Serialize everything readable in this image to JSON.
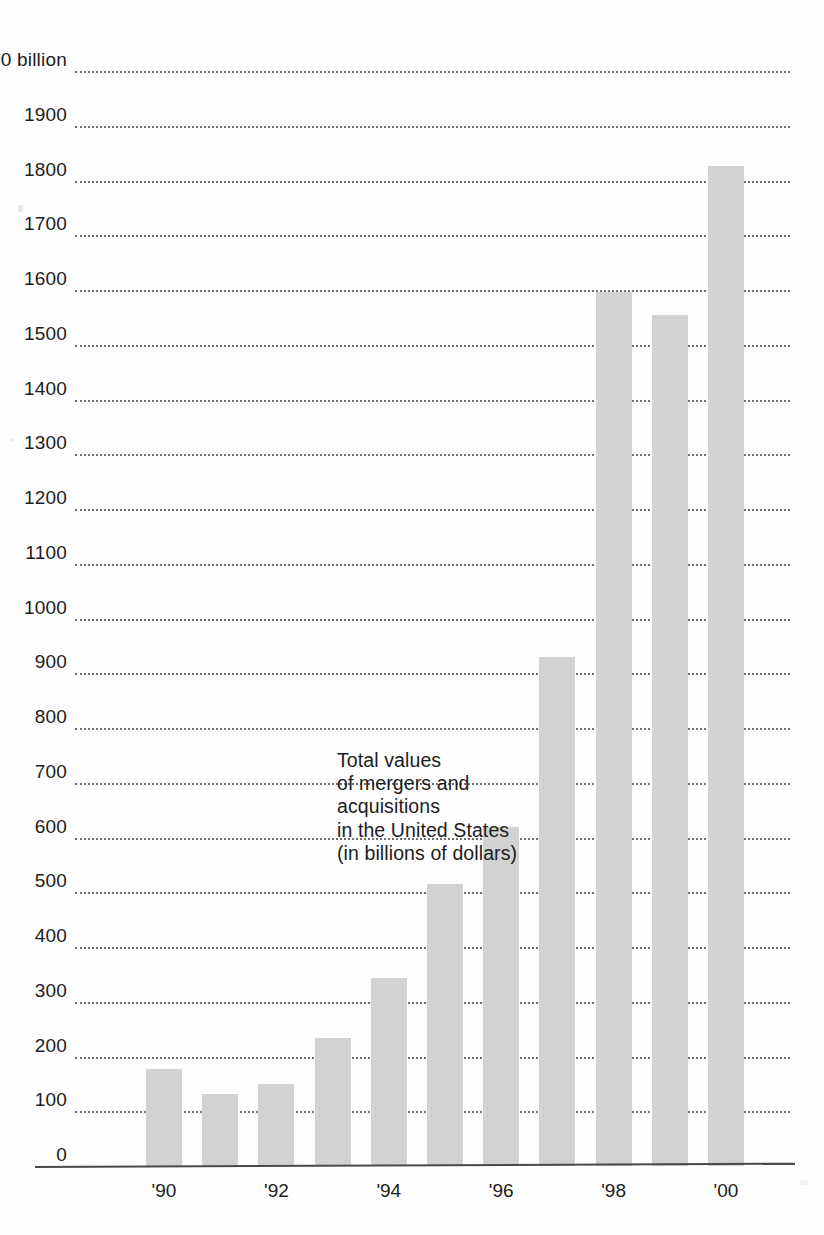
{
  "chart_data": {
    "type": "bar",
    "title": "",
    "annotation": [
      "Total values",
      "of mergers and",
      "acquisitions",
      "in the United States",
      "(in billions of dollars)"
    ],
    "units_label": "$ 2000 billion",
    "xlabel": "",
    "ylabel": "",
    "ylim": [
      0,
      2000
    ],
    "ytick_step": 100,
    "grid": true,
    "legend": "none",
    "categories": [
      "'90",
      "'91",
      "'92",
      "'93",
      "'94",
      "'95",
      "'96",
      "'97",
      "'98",
      "'99",
      "'00"
    ],
    "xtick_labels_shown": [
      "'90",
      "'92",
      "'94",
      "'96",
      "'98",
      "'00"
    ],
    "values": [
      177,
      132,
      149,
      233,
      343,
      515,
      620,
      930,
      1597,
      1555,
      1827
    ],
    "ytick_labels": [
      "$ 2000 billion",
      "1900",
      "1800",
      "1700",
      "1600",
      "1500",
      "1400",
      "1300",
      "1200",
      "1100",
      "1000",
      "900",
      "800",
      "700",
      "600",
      "500",
      "400",
      "300",
      "200",
      "100",
      "0"
    ],
    "ytick_values": [
      2000,
      1900,
      1800,
      1700,
      1600,
      1500,
      1400,
      1300,
      1200,
      1100,
      1000,
      900,
      800,
      700,
      600,
      500,
      400,
      300,
      200,
      100,
      0
    ],
    "colors": {
      "bar": "#d2d2d2",
      "grid": "#555555",
      "axis": "#4a4a4a",
      "text": "#1c1c1c",
      "background": "#fefefe"
    }
  }
}
